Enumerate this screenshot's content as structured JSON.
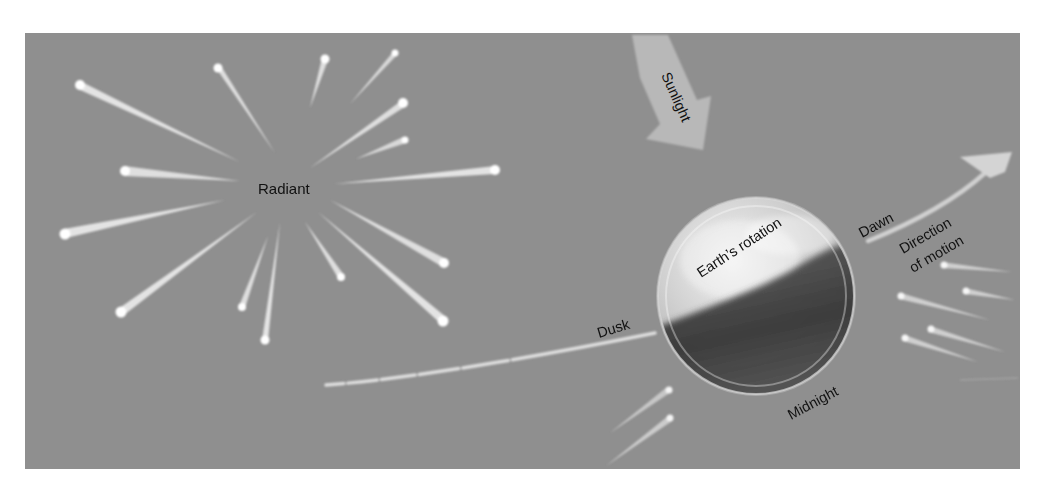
{
  "colors": {
    "page_background": "#ffffff",
    "panel_background": "#8f8f8f",
    "meteor": "#f4f4f4",
    "arrow_light": "#b9b9b9",
    "earth_light": "#e4e4e4",
    "earth_dark": "#3e3e3e",
    "text": "#111111"
  },
  "labels": {
    "radiant": "Radiant",
    "sunlight": "Sunlight",
    "earths_rotation": "Earth’s rotation",
    "dawn": "Dawn",
    "direction_line1": "Direction",
    "direction_line2": "of motion",
    "dusk": "Dusk",
    "midnight": "Midnight"
  },
  "icons": {
    "sunlight_arrow": "arrow-down-right",
    "motion_arrow": "arrow-up-right",
    "earth": "globe"
  }
}
